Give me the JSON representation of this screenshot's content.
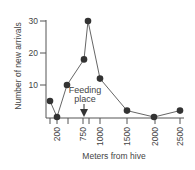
{
  "chart_data": {
    "type": "line",
    "title": "",
    "xlabel": "Meters from hive",
    "ylabel": "Number of new arrivals",
    "x": [
      100,
      200,
      400,
      700,
      800,
      1000,
      1500,
      2000,
      2500
    ],
    "x_px": [
      50,
      57,
      67,
      84,
      88,
      100,
      127,
      154,
      180
    ],
    "values": [
      5,
      0,
      10,
      18,
      30,
      12,
      2,
      0,
      2
    ],
    "ylim": [
      0,
      30
    ],
    "y_ticks": [
      10,
      20,
      30
    ],
    "x_tick_px": [
      50,
      57,
      68,
      83,
      89,
      100,
      127,
      155,
      180
    ],
    "x_tick_labels": [
      {
        "label": "200",
        "px": 57
      },
      {
        "label": "750",
        "px": 83
      },
      {
        "label": "1000",
        "px": 100
      },
      {
        "label": "1500",
        "px": 127
      },
      {
        "label": "2000",
        "px": 155
      },
      {
        "label": "2500",
        "px": 180
      }
    ],
    "annotations": [
      {
        "text_line1": "Feeding",
        "text_line2": "place",
        "x": 750,
        "type": "arrow-down"
      }
    ],
    "grid": false,
    "legend": null
  },
  "colors": {
    "line": "#666666",
    "marker": "#333333",
    "axis": "#555555",
    "text": "#444444"
  }
}
